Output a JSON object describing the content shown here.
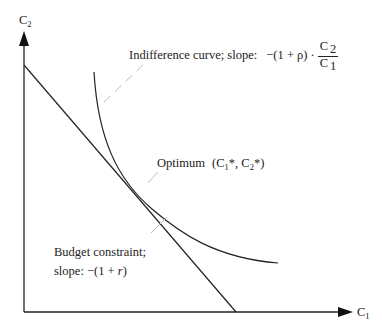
{
  "diagram": {
    "type": "intertemporal-choice",
    "axes": {
      "x_label": "C",
      "x_label_sub": "1",
      "y_label": "C",
      "y_label_sub": "2"
    },
    "labels": {
      "indifference": {
        "text": "Indifference curve; slope:",
        "formula_prefix": "−(1 + ρ) ·",
        "frac_num": "C",
        "frac_num_sub": "2",
        "frac_den": "C",
        "frac_den_sub": "1"
      },
      "optimum": {
        "text": "Optimum",
        "coord_open": "(C",
        "sub1": "1",
        "mid": "*, C",
        "sub2": "2",
        "coord_close": "*)"
      },
      "budget": {
        "line1": "Budget constraint;",
        "line2_prefix": "slope: −(1 + ",
        "line2_var": "r",
        "line2_suffix": ")"
      }
    },
    "colors": {
      "line": "#222222",
      "leader": "#bdbdbd"
    }
  }
}
